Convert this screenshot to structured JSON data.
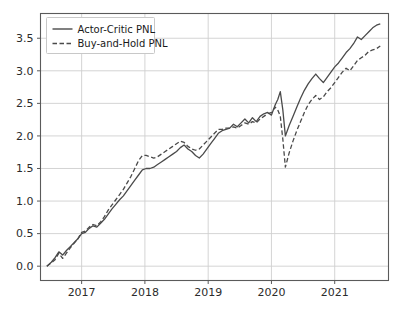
{
  "chart_data": {
    "type": "line",
    "title": "",
    "xlabel": "",
    "ylabel": "",
    "xlim": [
      2016.35,
      2021.85
    ],
    "ylim": [
      -0.22,
      3.88
    ],
    "grid": true,
    "legend_position": "upper left",
    "x_tick_labels": [
      "2017",
      "2018",
      "2019",
      "2020",
      "2021"
    ],
    "x_tick_values": [
      2017,
      2018,
      2019,
      2020,
      2021
    ],
    "y_tick_labels": [
      "0.0",
      "0.5",
      "1.0",
      "1.5",
      "2.0",
      "2.5",
      "3.0",
      "3.5"
    ],
    "y_tick_values": [
      0.0,
      0.5,
      1.0,
      1.5,
      2.0,
      2.5,
      3.0,
      3.5
    ],
    "series": [
      {
        "name": "Actor-Critic PNL",
        "style": "solid",
        "color": "#4a4a4a",
        "x": [
          2016.45,
          2016.52,
          2016.58,
          2016.64,
          2016.7,
          2016.76,
          2016.82,
          2016.88,
          2016.94,
          2017.0,
          2017.06,
          2017.12,
          2017.18,
          2017.24,
          2017.3,
          2017.36,
          2017.42,
          2017.48,
          2017.54,
          2017.6,
          2017.66,
          2017.72,
          2017.78,
          2017.84,
          2017.9,
          2017.96,
          2018.02,
          2018.08,
          2018.14,
          2018.2,
          2018.26,
          2018.32,
          2018.38,
          2018.44,
          2018.5,
          2018.56,
          2018.62,
          2018.68,
          2018.74,
          2018.8,
          2018.86,
          2018.92,
          2018.98,
          2019.04,
          2019.1,
          2019.16,
          2019.22,
          2019.28,
          2019.34,
          2019.4,
          2019.46,
          2019.52,
          2019.58,
          2019.64,
          2019.7,
          2019.76,
          2019.82,
          2019.88,
          2019.94,
          2020.0,
          2020.06,
          2020.1,
          2020.14,
          2020.18,
          2020.22,
          2020.28,
          2020.34,
          2020.4,
          2020.46,
          2020.52,
          2020.58,
          2020.64,
          2020.7,
          2020.76,
          2020.82,
          2020.88,
          2020.94,
          2021.0,
          2021.06,
          2021.12,
          2021.18,
          2021.24,
          2021.3,
          2021.36,
          2021.42,
          2021.48,
          2021.54,
          2021.6,
          2021.66,
          2021.72
        ],
        "y": [
          0.0,
          0.06,
          0.13,
          0.22,
          0.17,
          0.24,
          0.3,
          0.36,
          0.42,
          0.5,
          0.52,
          0.58,
          0.62,
          0.6,
          0.66,
          0.72,
          0.8,
          0.88,
          0.95,
          1.02,
          1.08,
          1.16,
          1.24,
          1.32,
          1.4,
          1.48,
          1.5,
          1.5,
          1.52,
          1.56,
          1.6,
          1.64,
          1.68,
          1.72,
          1.76,
          1.82,
          1.86,
          1.8,
          1.76,
          1.7,
          1.66,
          1.72,
          1.8,
          1.88,
          1.96,
          2.04,
          2.08,
          2.1,
          2.12,
          2.18,
          2.14,
          2.2,
          2.26,
          2.2,
          2.28,
          2.22,
          2.3,
          2.34,
          2.36,
          2.32,
          2.48,
          2.56,
          2.68,
          2.4,
          2.0,
          2.16,
          2.3,
          2.44,
          2.58,
          2.7,
          2.8,
          2.88,
          2.95,
          2.88,
          2.82,
          2.9,
          2.98,
          3.06,
          3.12,
          3.2,
          3.28,
          3.34,
          3.42,
          3.52,
          3.48,
          3.54,
          3.6,
          3.66,
          3.7,
          3.72
        ]
      },
      {
        "name": "Buy-and-Hold PNL",
        "style": "dashed",
        "color": "#4a4a4a",
        "x": [
          2016.45,
          2016.52,
          2016.58,
          2016.64,
          2016.7,
          2016.76,
          2016.82,
          2016.88,
          2016.94,
          2017.0,
          2017.06,
          2017.12,
          2017.18,
          2017.24,
          2017.3,
          2017.36,
          2017.42,
          2017.48,
          2017.54,
          2017.6,
          2017.66,
          2017.72,
          2017.78,
          2017.84,
          2017.9,
          2017.96,
          2018.02,
          2018.08,
          2018.14,
          2018.2,
          2018.26,
          2018.32,
          2018.38,
          2018.44,
          2018.5,
          2018.56,
          2018.62,
          2018.68,
          2018.74,
          2018.8,
          2018.86,
          2018.92,
          2018.98,
          2019.04,
          2019.1,
          2019.16,
          2019.22,
          2019.28,
          2019.34,
          2019.4,
          2019.46,
          2019.52,
          2019.58,
          2019.64,
          2019.7,
          2019.76,
          2019.82,
          2019.88,
          2019.94,
          2020.0,
          2020.06,
          2020.1,
          2020.14,
          2020.18,
          2020.22,
          2020.28,
          2020.34,
          2020.4,
          2020.46,
          2020.52,
          2020.58,
          2020.64,
          2020.7,
          2020.76,
          2020.82,
          2020.88,
          2020.94,
          2021.0,
          2021.06,
          2021.12,
          2021.18,
          2021.24,
          2021.3,
          2021.36,
          2021.42,
          2021.48,
          2021.54,
          2021.6,
          2021.66,
          2021.72
        ],
        "y": [
          0.0,
          0.05,
          0.1,
          0.2,
          0.12,
          0.2,
          0.28,
          0.35,
          0.42,
          0.52,
          0.54,
          0.6,
          0.64,
          0.62,
          0.68,
          0.76,
          0.86,
          0.94,
          1.02,
          1.1,
          1.18,
          1.28,
          1.38,
          1.5,
          1.62,
          1.7,
          1.7,
          1.68,
          1.66,
          1.68,
          1.72,
          1.76,
          1.8,
          1.84,
          1.88,
          1.92,
          1.9,
          1.84,
          1.8,
          1.78,
          1.8,
          1.86,
          1.92,
          1.98,
          2.04,
          2.1,
          2.1,
          2.12,
          2.12,
          2.14,
          2.12,
          2.16,
          2.2,
          2.18,
          2.22,
          2.2,
          2.26,
          2.3,
          2.34,
          2.36,
          2.44,
          2.4,
          2.3,
          1.95,
          1.52,
          1.74,
          1.92,
          2.08,
          2.22,
          2.36,
          2.48,
          2.56,
          2.62,
          2.56,
          2.6,
          2.68,
          2.74,
          2.82,
          2.9,
          2.98,
          3.04,
          3.0,
          3.08,
          3.16,
          3.2,
          3.24,
          3.3,
          3.32,
          3.34,
          3.38
        ]
      }
    ]
  },
  "legend": {
    "entries": [
      {
        "label": "Actor-Critic PNL",
        "style": "solid"
      },
      {
        "label": "Buy-and-Hold PNL",
        "style": "dashed"
      }
    ]
  },
  "colors": {
    "line": "#4a4a4a",
    "grid": "#cfcfcf",
    "spine": "#5a5a5a",
    "text": "#2b2b2b",
    "background": "#ffffff"
  }
}
